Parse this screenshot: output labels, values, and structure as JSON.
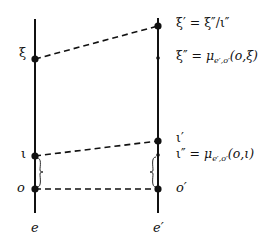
{
  "diagram": {
    "lines": {
      "left": {
        "label": "e",
        "x": 35,
        "y1": 19,
        "y2": 213
      },
      "right": {
        "label": "e′",
        "x": 158,
        "y1": 18,
        "y2": 213
      }
    },
    "points": {
      "xi": {
        "label": "ξ",
        "x": 35,
        "y": 59
      },
      "iota": {
        "label": "ι",
        "x": 35,
        "y": 156
      },
      "o": {
        "label": "o",
        "x": 35,
        "y": 189
      },
      "xi_prime": {
        "label": "ξ′",
        "x": 158,
        "y": 26
      },
      "xi_dprime": {
        "label": "ξ″",
        "x": 158,
        "y": 58
      },
      "iota_prime": {
        "label": "ι′",
        "x": 158,
        "y": 141
      },
      "iota_dprime": {
        "label": "ι″",
        "x": 158,
        "y": 155
      },
      "o_prime": {
        "label": "o′",
        "x": 158,
        "y": 189
      }
    },
    "equations": {
      "xi_prime_eq": {
        "lhs": "ξ′",
        "rel": " = ",
        "rhs": "ξ″/ι″"
      },
      "xi_dprime_eq": {
        "lhs": "ξ″",
        "rel": " = ",
        "mu": "μ",
        "sub": "e′,o′",
        "args": "(o,ξ)"
      },
      "iota_prime_label": "ι′",
      "iota_dprime_eq": {
        "lhs": "ι″",
        "rel": " = ",
        "mu": "μ",
        "sub": "e′,o′",
        "args": "(o,ι)"
      }
    },
    "bottom_labels": {
      "left": "e",
      "right": "e′"
    },
    "colors": {
      "ink": "#111111",
      "background": "#ffffff"
    }
  }
}
